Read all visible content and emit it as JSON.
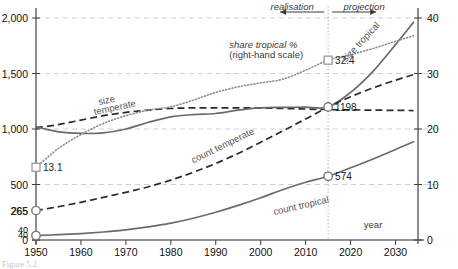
{
  "chart_data": {
    "type": "line",
    "title": "",
    "xlabel": "year",
    "ylabel": "",
    "y2label": "",
    "xlim": [
      1950,
      2035
    ],
    "ylim": [
      0,
      2000
    ],
    "y2lim": [
      0,
      40
    ],
    "grid": true,
    "legend": "inline-labels",
    "x_ticks": [
      "1950",
      "1960",
      "1970",
      "1980",
      "1990",
      "2000",
      "2010",
      "2020",
      "2030"
    ],
    "x_tick_values": [
      1950,
      1960,
      1970,
      1980,
      1990,
      2000,
      2010,
      2020,
      2030
    ],
    "y_ticks": [
      "0",
      "500",
      "1,000",
      "1,500",
      "2,000"
    ],
    "y_tick_values": [
      0,
      500,
      1000,
      1500,
      2000
    ],
    "y_extra_ticks": [
      "40",
      "265"
    ],
    "y_extra_tick_values": [
      40,
      265
    ],
    "y2_ticks": [
      "0",
      "10",
      "20",
      "30",
      "40"
    ],
    "y2_tick_values": [
      0,
      10,
      20,
      30,
      40
    ],
    "divider_year": 2015,
    "annotations": [
      {
        "text": "realisation",
        "x": 2007,
        "y": 2075,
        "style": "italic"
      },
      {
        "text": "projection",
        "x": 2023,
        "y": 2075,
        "style": "italic"
      },
      {
        "text": "share tropical %",
        "x": 1993,
        "y": 1730,
        "style": "italic"
      },
      {
        "text": "(right-hand scale)",
        "x": 1993,
        "y": 1640,
        "style": "plain"
      },
      {
        "text": "size tropical",
        "x": 2019,
        "y": 1600,
        "style": "plain"
      },
      {
        "text": "size",
        "x": 1964,
        "y": 1215,
        "style": "plain"
      },
      {
        "text": "temperate",
        "x": 1963,
        "y": 1125,
        "style": "plain"
      },
      {
        "text": "count temperate",
        "x": 1985,
        "y": 690,
        "style": "plain"
      },
      {
        "text": "count tropical",
        "x": 2003,
        "y": 225,
        "style": "plain"
      },
      {
        "text": "year",
        "x": 2025,
        "y": 105,
        "style": "plain"
      }
    ],
    "point_labels": [
      {
        "text": "13.1",
        "x": 1950,
        "value": 13.1,
        "axis": "right",
        "marker": "square"
      },
      {
        "text": "32.4",
        "x": 2015,
        "value": 32.4,
        "axis": "right",
        "marker": "square"
      },
      {
        "text": "1198",
        "x": 2015,
        "value": 1198,
        "axis": "left",
        "marker": "circle"
      },
      {
        "text": "574",
        "x": 2015,
        "value": 574,
        "axis": "left",
        "marker": "circle"
      },
      {
        "text": "265",
        "x": 1950,
        "value": 265,
        "axis": "left",
        "marker": "circle"
      },
      {
        "text": "40",
        "x": 1950,
        "value": 40,
        "axis": "left",
        "marker": "circle"
      }
    ],
    "series": [
      {
        "name": "size temperate",
        "axis": "left",
        "style": "dashed",
        "x": [
          1950,
          1955,
          1960,
          1965,
          1970,
          1975,
          1980,
          1985,
          1990,
          1995,
          2000,
          2005,
          2010,
          2015,
          2020,
          2025,
          2030,
          2034
        ],
        "values": [
          1010,
          1040,
          1080,
          1120,
          1150,
          1170,
          1185,
          1190,
          1190,
          1190,
          1188,
          1185,
          1180,
          1175,
          1172,
          1170,
          1168,
          1166
        ]
      },
      {
        "name": "size tropical",
        "axis": "left",
        "style": "solid",
        "x": [
          1950,
          1955,
          1960,
          1965,
          1970,
          1975,
          1980,
          1985,
          1990,
          1995,
          2000,
          2005,
          2010,
          2015,
          2020,
          2025,
          2030,
          2034
        ],
        "values": [
          1020,
          975,
          960,
          965,
          1000,
          1060,
          1110,
          1130,
          1140,
          1170,
          1190,
          1195,
          1196,
          1198,
          1330,
          1520,
          1760,
          1960
        ]
      },
      {
        "name": "share tropical %",
        "axis": "right",
        "style": "dotted",
        "x": [
          1950,
          1955,
          1960,
          1965,
          1970,
          1975,
          1980,
          1985,
          1990,
          1995,
          2000,
          2005,
          2010,
          2015,
          2020,
          2025,
          2030,
          2034
        ],
        "values": [
          13.1,
          16.5,
          19.0,
          21.0,
          22.4,
          23.4,
          24.0,
          25.2,
          26.6,
          27.6,
          28.3,
          29.0,
          30.6,
          32.4,
          33.4,
          34.5,
          35.8,
          36.8
        ]
      },
      {
        "name": "count temperate",
        "axis": "left",
        "style": "dashed",
        "x": [
          1950,
          1955,
          1960,
          1965,
          1970,
          1975,
          1980,
          1985,
          1990,
          1995,
          2000,
          2005,
          2010,
          2015,
          2020,
          2025,
          2030,
          2034
        ],
        "values": [
          265,
          300,
          340,
          385,
          430,
          480,
          540,
          610,
          690,
          780,
          880,
          985,
          1090,
          1198,
          1290,
          1370,
          1440,
          1490
        ]
      },
      {
        "name": "count tropical",
        "axis": "left",
        "style": "solid",
        "x": [
          1950,
          1955,
          1960,
          1965,
          1970,
          1975,
          1980,
          1985,
          1990,
          1995,
          2000,
          2005,
          2010,
          2015,
          2020,
          2025,
          2030,
          2034
        ],
        "values": [
          40,
          48,
          58,
          72,
          92,
          118,
          152,
          196,
          250,
          312,
          380,
          455,
          520,
          574,
          650,
          730,
          815,
          885
        ]
      }
    ]
  },
  "figure": {
    "caption": "Figure 5.2"
  }
}
